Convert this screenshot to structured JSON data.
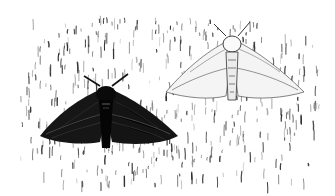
{
  "image": {
    "description": "Black-and-white illustration of two peppered moths resting on lichen-covered bark: a dark (melanic) form on the left and a light (typical) form on the right",
    "width": 335,
    "height": 196,
    "background": "#ffffff",
    "ink": "#111111",
    "subjects": [
      {
        "name": "dark-moth",
        "form": "melanic",
        "head": [
          105,
          88
        ],
        "wing_span": [
          38,
          178
        ],
        "y_range": [
          84,
          150
        ]
      },
      {
        "name": "light-moth",
        "form": "typical",
        "head": [
          232,
          38
        ],
        "wing_span": [
          165,
          305
        ],
        "y_range": [
          32,
          102
        ]
      }
    ]
  }
}
